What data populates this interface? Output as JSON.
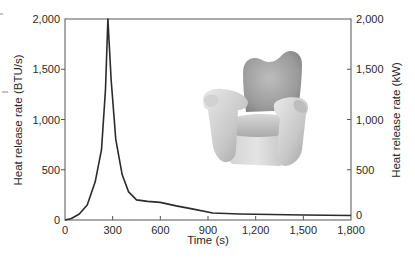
{
  "chart_data": {
    "type": "line",
    "title": "",
    "xlabel": "Time (s)",
    "ylabel": "Heat release rate (BTU/s)",
    "ylabel_right": "Heat release rate (kW)",
    "xlim": [
      0,
      1800
    ],
    "ylim": [
      0,
      2000
    ],
    "ylim_right": [
      0,
      2000
    ],
    "grid": false,
    "legend": null,
    "x_ticks": [
      0,
      300,
      600,
      900,
      1200,
      1500,
      1800
    ],
    "x_tick_labels": [
      "0",
      "300",
      "600",
      "900",
      "1,200",
      "1,500",
      "1,800"
    ],
    "y_ticks": [
      0,
      500,
      1000,
      1500,
      2000
    ],
    "y_tick_labels": [
      "0",
      "500",
      "1,000",
      "1,500",
      "2,000"
    ],
    "y_right_ticks": [
      0,
      500,
      1000,
      1500,
      2000
    ],
    "y_right_tick_labels": [
      "0",
      "500",
      "1,000",
      "1,500",
      "2,000"
    ],
    "series": [
      {
        "name": "Upholstered armchair heat release rate",
        "x": [
          0,
          40,
          90,
          140,
          190,
          230,
          255,
          270,
          290,
          320,
          360,
          400,
          450,
          520,
          600,
          700,
          800,
          930,
          1100,
          1300,
          1500,
          1800
        ],
        "y": [
          0,
          15,
          60,
          150,
          380,
          700,
          1300,
          2000,
          1400,
          800,
          450,
          280,
          200,
          185,
          175,
          140,
          110,
          70,
          60,
          55,
          50,
          45
        ]
      }
    ],
    "annotations": [
      {
        "type": "image",
        "description": "Illustration of an upholstered armchair",
        "position": "upper-right inside plot"
      }
    ]
  },
  "labels": {
    "x_axis_title": "Time (s)",
    "y_axis_title_left": "Heat release rate (BTU/s)",
    "y_axis_title_right": "Heat release rate (kW)"
  },
  "illustration": {
    "name": "armchair",
    "colors": {
      "light": "#e6e6e6",
      "mid": "#b8b8b8",
      "dark": "#8a8a8a"
    }
  }
}
